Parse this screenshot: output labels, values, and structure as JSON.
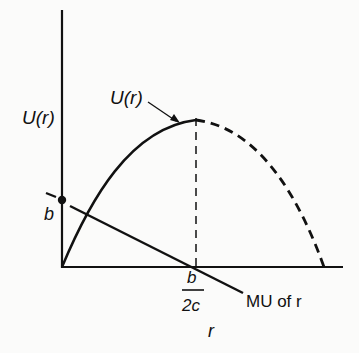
{
  "diagram": {
    "type": "economics-utility-curve",
    "y_axis_label": "U(r)",
    "x_axis_label": "r",
    "curve_label": "U(r)",
    "mu_line_label": "MU of r",
    "intercept_label": "b",
    "peak_x_label_numerator": "b",
    "peak_x_label_denominator": "2c",
    "colors": {
      "ink": "#111111",
      "background": "#fbfbfa"
    }
  }
}
